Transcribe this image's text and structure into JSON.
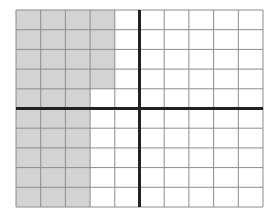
{
  "diagram": {
    "type": "grid",
    "columns": 10,
    "rows": 10,
    "origin_px": [
      16,
      10
    ],
    "cell_width": 24.7,
    "cell_height": 19.7,
    "axis_vertical_col": 5,
    "axis_horizontal_row": 5,
    "shaded_cells": [
      [
        0,
        0
      ],
      [
        1,
        0
      ],
      [
        2,
        0
      ],
      [
        3,
        0
      ],
      [
        0,
        1
      ],
      [
        1,
        1
      ],
      [
        2,
        1
      ],
      [
        3,
        1
      ],
      [
        0,
        2
      ],
      [
        1,
        2
      ],
      [
        2,
        2
      ],
      [
        3,
        2
      ],
      [
        0,
        3
      ],
      [
        1,
        3
      ],
      [
        2,
        3
      ],
      [
        3,
        3
      ],
      [
        0,
        4
      ],
      [
        1,
        4
      ],
      [
        2,
        4
      ],
      [
        0,
        5
      ],
      [
        1,
        5
      ],
      [
        2,
        5
      ],
      [
        0,
        6
      ],
      [
        1,
        6
      ],
      [
        2,
        6
      ],
      [
        0,
        7
      ],
      [
        1,
        7
      ],
      [
        2,
        7
      ],
      [
        0,
        8
      ],
      [
        1,
        8
      ],
      [
        2,
        8
      ],
      [
        0,
        9
      ],
      [
        1,
        9
      ],
      [
        2,
        9
      ]
    ],
    "shaded_count": 34,
    "total_cells": 100
  },
  "colors": {
    "shade": "#d3d3d3",
    "grid_line": "#8c8c8c",
    "axis_line": "#222222",
    "background": "#ffffff"
  }
}
